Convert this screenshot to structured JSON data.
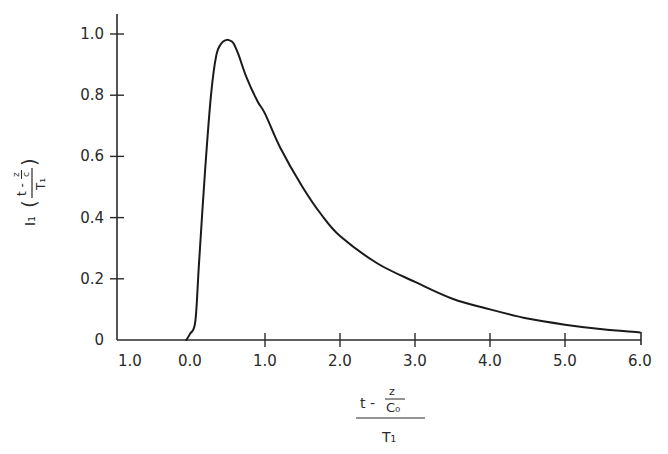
{
  "chart_data": {
    "type": "line",
    "title": "",
    "xlabel": "(t - z/C₀) / T₁",
    "xlabel_parts": {
      "numerator_left": "t -",
      "numerator_frac_top": "z",
      "numerator_frac_bottom": "C₀",
      "denominator": "T₁"
    },
    "ylabel": "I₁ ((t - z/c) / T₁)",
    "ylabel_parts": {
      "func": "I₁",
      "numerator_left": "t -",
      "numerator_frac_top": "z",
      "numerator_frac_bottom": "c",
      "denominator": "T₁"
    },
    "xlim": [
      -1.0,
      6.0
    ],
    "ylim": [
      0,
      1.05
    ],
    "grid": false,
    "legend": null,
    "x_ticks": [
      {
        "value": -1.0,
        "label": "1.0"
      },
      {
        "value": 0.0,
        "label": "0.0"
      },
      {
        "value": 1.0,
        "label": "1.0"
      },
      {
        "value": 2.0,
        "label": "2.0"
      },
      {
        "value": 3.0,
        "label": "3.0"
      },
      {
        "value": 4.0,
        "label": "4.0"
      },
      {
        "value": 5.0,
        "label": "5.0"
      },
      {
        "value": 6.0,
        "label": "6.0"
      }
    ],
    "y_ticks": [
      {
        "value": 0,
        "label": "0"
      },
      {
        "value": 0.2,
        "label": "0.2"
      },
      {
        "value": 0.4,
        "label": "0.4"
      },
      {
        "value": 0.6,
        "label": "0.6"
      },
      {
        "value": 0.8,
        "label": "0.8"
      },
      {
        "value": 1.0,
        "label": "1.0"
      }
    ],
    "series": [
      {
        "name": "I1",
        "color": "#1a1a1a",
        "x": [
          -0.05,
          0.0,
          0.07,
          0.12,
          0.2,
          0.28,
          0.35,
          0.42,
          0.48,
          0.52,
          0.58,
          0.65,
          0.75,
          0.9,
          1.0,
          1.2,
          1.5,
          1.75,
          2.0,
          2.5,
          3.0,
          3.5,
          4.0,
          4.5,
          5.0,
          5.5,
          6.0
        ],
        "values": [
          0.0,
          0.02,
          0.06,
          0.25,
          0.55,
          0.8,
          0.93,
          0.97,
          0.98,
          0.98,
          0.97,
          0.93,
          0.86,
          0.78,
          0.74,
          0.63,
          0.5,
          0.41,
          0.34,
          0.25,
          0.19,
          0.135,
          0.1,
          0.07,
          0.05,
          0.035,
          0.025
        ]
      }
    ]
  }
}
